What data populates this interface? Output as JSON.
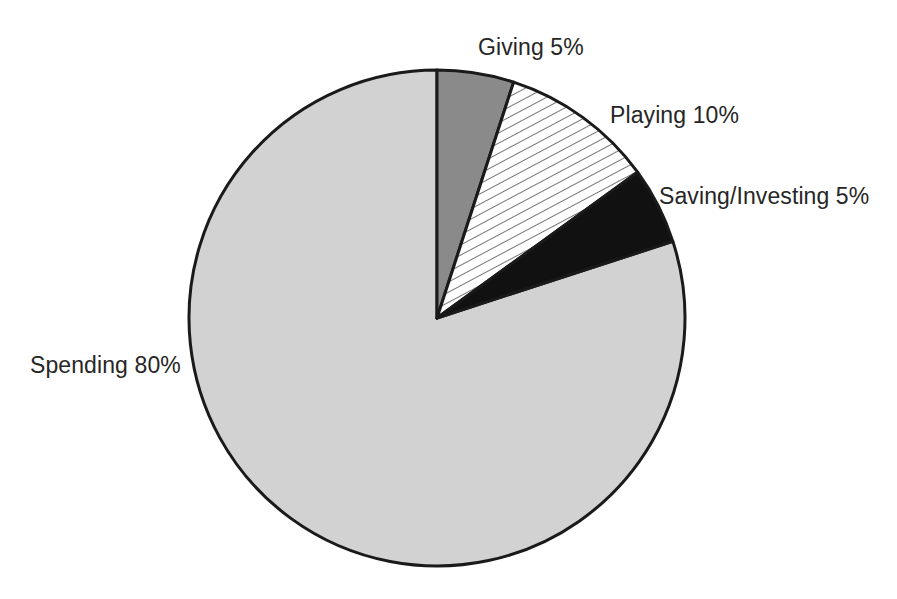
{
  "chart_data": {
    "type": "pie",
    "title": "",
    "subtitle": "",
    "xlabel": "",
    "ylabel": "",
    "legend_position": "none",
    "grid": false,
    "start_angle_deg": 0,
    "direction": "clockwise",
    "center": {
      "x": 437,
      "y": 318
    },
    "radius": 248,
    "categories": [
      "Giving",
      "Playing",
      "Saving/Investing",
      "Spending"
    ],
    "values": [
      5,
      10,
      5,
      80
    ],
    "units": "%",
    "slices": [
      {
        "name": "Giving",
        "value": 5,
        "label": "Giving 5%",
        "fill": "#8a8a8a",
        "pattern": "solid",
        "start_deg": 0,
        "end_deg": 18,
        "label_x": 478,
        "label_y": 55
      },
      {
        "name": "Playing",
        "value": 10,
        "label": "Playing 10%",
        "fill": "#ffffff",
        "pattern": "diagonal-hatch",
        "start_deg": 18,
        "end_deg": 54,
        "label_x": 610,
        "label_y": 123
      },
      {
        "name": "Saving/Investing",
        "value": 5,
        "label": "Saving/Investing 5%",
        "fill": "#111111",
        "pattern": "solid",
        "start_deg": 54,
        "end_deg": 72,
        "label_x": 659,
        "label_y": 204
      },
      {
        "name": "Spending",
        "value": 80,
        "label": "Spending 80%",
        "fill": "#d2d2d2",
        "pattern": "solid",
        "start_deg": 72,
        "end_deg": 360,
        "label_x": 30,
        "label_y": 373
      }
    ],
    "colors": {
      "outline": "#1a1a1a",
      "background": "#ffffff",
      "text": "#262626",
      "giving": "#8a8a8a",
      "playing": "#ffffff",
      "saving_investing": "#111111",
      "spending": "#d2d2d2"
    }
  }
}
